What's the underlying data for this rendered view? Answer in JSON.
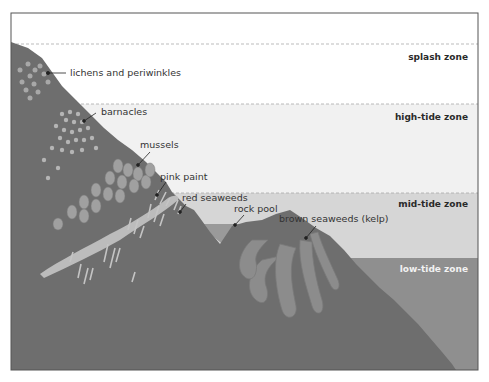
{
  "zones": [
    {
      "id": "splash",
      "label": "splash zone",
      "top": 44,
      "bottom": 104,
      "fill": "#ffffff"
    },
    {
      "id": "high",
      "label": "high-tide zone",
      "top": 104,
      "bottom": 193,
      "fill": "#f1f1f1"
    },
    {
      "id": "mid",
      "label": "mid-tide zone",
      "top": 193,
      "bottom": 258,
      "fill": "#d6d6d6"
    },
    {
      "id": "low",
      "label": "low-tide zone",
      "top": 258,
      "bottom": 370,
      "fill": "#8f8f8f"
    }
  ],
  "labels": {
    "lichens": "lichens and periwinkles",
    "barnacles": "barnacles",
    "mussels": "mussels",
    "pink_paint": "pink paint",
    "red_seaweeds": "red seaweeds",
    "rock_pool": "rock pool",
    "brown_seaweeds": "brown seaweeds (kelp)"
  },
  "colors": {
    "rock": "#6e6e6e",
    "rock_dark": "#5f5f5f",
    "kelp": "#8c8c8c",
    "pool": "#9a9a9a",
    "frame": "#555555",
    "organism": "#bdbdbd"
  }
}
